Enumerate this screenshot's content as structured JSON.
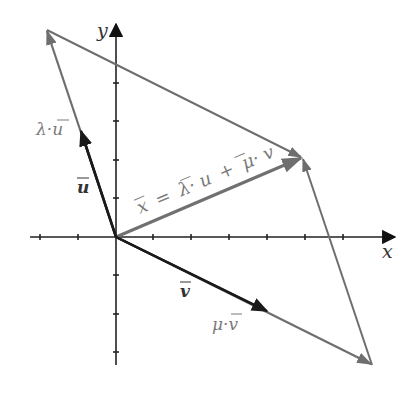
{
  "diagram": {
    "colors": {
      "axis": "#222222",
      "basis_vector": "#1a1a1a",
      "scaled_vector": "#6e6e6e",
      "result_vector": "#707070",
      "label_gray": "#7a7a7a",
      "label_dark": "#333333"
    },
    "axes": {
      "x_label": "x",
      "y_label": "y",
      "origin_px": [
        116,
        237
      ],
      "tick_spacing_px": 38.3,
      "x_ticks": [
        -2,
        -1,
        1,
        2,
        3,
        4,
        5,
        6
      ],
      "y_ticks": [
        -3,
        -2,
        -1,
        1,
        2,
        3,
        4
      ]
    },
    "vectors": {
      "u": {
        "label": "u",
        "from": [
          0,
          0
        ],
        "to": [
          -0.92,
          2.7
        ]
      },
      "v": {
        "label": "v",
        "from": [
          0,
          0
        ],
        "to": [
          4.0,
          -1.93
        ]
      },
      "lambda_u": {
        "label": "λ·u",
        "from": [
          0,
          0
        ],
        "to": [
          -1.8,
          5.4
        ]
      },
      "mu_v": {
        "label": "μ·v",
        "from": [
          0,
          0
        ],
        "to": [
          6.68,
          -3.35
        ]
      },
      "x": {
        "label": "x = λ·u + μ·v",
        "from": [
          0,
          0
        ],
        "to": [
          4.86,
          2.09
        ]
      }
    },
    "labels": {
      "x_axis": "x",
      "y_axis": "y",
      "u": "u",
      "v": "v",
      "lambda_u": "λ·u",
      "mu_v": "μ·v",
      "x_vec_lhs": "x",
      "x_vec_eq": "=",
      "x_vec_lambda": "λ·",
      "x_vec_u": "u",
      "x_vec_plus": "+",
      "x_vec_mu": "μ·",
      "x_vec_v": "v"
    }
  }
}
